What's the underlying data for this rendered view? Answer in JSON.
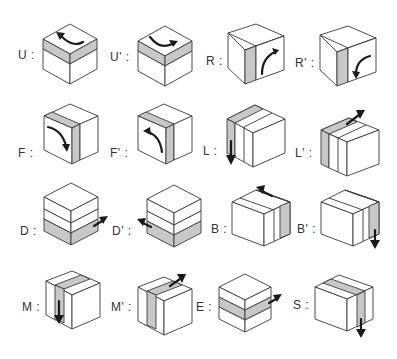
{
  "colors": {
    "highlight": "#c8c8c8",
    "outline": "#3a3a3a",
    "arrow": "#1a1a1a",
    "background": "#ffffff"
  },
  "moves": [
    {
      "id": "U",
      "label": "U :",
      "layer": "top",
      "direction": "counterclockwise-left"
    },
    {
      "id": "U'",
      "label": "U' :",
      "layer": "top",
      "direction": "clockwise-right"
    },
    {
      "id": "R",
      "label": "R :",
      "layer": "right",
      "direction": "up"
    },
    {
      "id": "R'",
      "label": "R' :",
      "layer": "right",
      "direction": "down"
    },
    {
      "id": "F",
      "label": "F :",
      "layer": "front",
      "direction": "clockwise"
    },
    {
      "id": "F'",
      "label": "F' :",
      "layer": "front",
      "direction": "counterclockwise"
    },
    {
      "id": "L",
      "label": "L :",
      "layer": "left",
      "direction": "down"
    },
    {
      "id": "L'",
      "label": "L' :",
      "layer": "left",
      "direction": "up"
    },
    {
      "id": "D",
      "label": "D :",
      "layer": "bottom",
      "direction": "right"
    },
    {
      "id": "D'",
      "label": "D' :",
      "layer": "bottom",
      "direction": "left"
    },
    {
      "id": "B",
      "label": "B :",
      "layer": "back",
      "direction": "up"
    },
    {
      "id": "B'",
      "label": "B' :",
      "layer": "back",
      "direction": "down"
    },
    {
      "id": "M",
      "label": "M :",
      "layer": "middle",
      "direction": "down"
    },
    {
      "id": "M'",
      "label": "M' :",
      "layer": "middle",
      "direction": "up"
    },
    {
      "id": "E",
      "label": "E :",
      "layer": "equator",
      "direction": "right"
    },
    {
      "id": "S",
      "label": "S :",
      "layer": "standing",
      "direction": "down"
    }
  ]
}
